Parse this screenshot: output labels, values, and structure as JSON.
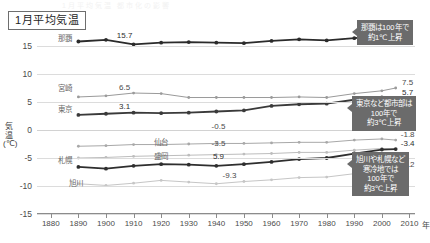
{
  "title": "1月平均気温",
  "top_crop_text": "1月平均気温 都市化の影響",
  "chart_data": {
    "type": "line",
    "title": "1月平均気温",
    "xlabel": "年",
    "ylabel": "気温(℃)",
    "ylim": [
      -15,
      17.5
    ],
    "xlim": [
      1875,
      2012
    ],
    "grid": true,
    "legend": "inline-labels",
    "yticks": [
      15,
      10,
      5,
      0,
      -5,
      -10,
      -15
    ],
    "ytick_labels": [
      "15",
      "10",
      "5",
      "0",
      "-5",
      "-10",
      "-15"
    ],
    "xticks": [
      1880,
      1890,
      1900,
      1910,
      1920,
      1930,
      1940,
      1950,
      1960,
      1970,
      1980,
      1990,
      2000,
      2010
    ],
    "xtick_labels": [
      "1880",
      "1890",
      "1900",
      "1910",
      "1920",
      "1930",
      "1940",
      "1950",
      "1960",
      "1970",
      "1980",
      "1990",
      "2000",
      "2010"
    ],
    "x_unit": "年",
    "x": [
      1890,
      1900,
      1910,
      1920,
      1930,
      1940,
      1950,
      1960,
      1970,
      1980,
      1990,
      2000,
      2005
    ],
    "series": [
      {
        "name": "那覇",
        "color": "#2b2b2b",
        "weight": "bold",
        "label_x": 1893,
        "label_value": 15.7,
        "label_text": "15.7",
        "end_label": "17",
        "values": [
          15.8,
          16.1,
          15.3,
          15.6,
          15.7,
          15.6,
          15.5,
          15.9,
          16.2,
          16.0,
          16.4,
          16.8,
          17.0
        ]
      },
      {
        "name": "宮崎",
        "color": "#9a9a9a",
        "weight": "normal",
        "label_x": 1893,
        "label_value": 6.5,
        "label_text": "6.5",
        "end_label": "7.5",
        "values": [
          5.9,
          6.1,
          6.6,
          6.5,
          5.8,
          5.8,
          5.8,
          5.8,
          5.9,
          5.8,
          6.5,
          7.0,
          7.5
        ]
      },
      {
        "name": "東京",
        "color": "#3a3a3a",
        "weight": "bold",
        "label_x": 1893,
        "label_value": 3.1,
        "label_text": "3.1",
        "end_label": "5.7",
        "values": [
          2.7,
          2.9,
          3.1,
          3.0,
          3.1,
          3.3,
          3.5,
          4.3,
          4.6,
          4.7,
          5.4,
          5.8,
          5.7
        ]
      },
      {
        "name": "仙台",
        "color": "#a8a8a8",
        "weight": "normal",
        "label_x": 1927,
        "label_value": -0.5,
        "label_text": "-0.5",
        "end_label": "-1.8",
        "values": [
          -2.9,
          -2.8,
          -2.6,
          -2.6,
          -2.5,
          -2.4,
          -2.4,
          -2.3,
          -2.2,
          -2.2,
          -1.8,
          -1.6,
          -1.8
        ]
      },
      {
        "name": "盛岡",
        "color": "#bdbdbd",
        "weight": "normal",
        "label_x": 1927,
        "label_value": -3.5,
        "label_text": "-3.5",
        "end_label": "",
        "values": [
          -5.0,
          -4.9,
          -4.7,
          -4.6,
          -4.5,
          -4.4,
          -4.3,
          -4.2,
          -4.0,
          -4.0,
          -3.6,
          -3.3,
          -3.5
        ]
      },
      {
        "name": "札幌",
        "color": "#2e2e2e",
        "weight": "bold",
        "label_x": 1927,
        "label_value": -5.9,
        "label_text": "5.9",
        "end_label": "-3.4",
        "values": [
          -6.6,
          -6.9,
          -6.4,
          -6.1,
          -6.2,
          -6.4,
          -6.1,
          -5.7,
          -5.2,
          -5.0,
          -4.2,
          -3.5,
          -3.4
        ]
      },
      {
        "name": "旭川",
        "color": "#c6c6c6",
        "weight": "normal",
        "label_x": 1931,
        "label_value": -9.3,
        "label_text": "-9.3",
        "end_label": "-7.2",
        "values": [
          -9.6,
          -9.9,
          -9.5,
          -9.0,
          -9.3,
          -9.6,
          -9.2,
          -8.9,
          -8.5,
          -8.4,
          -7.8,
          -7.2,
          -7.2
        ]
      }
    ],
    "series_name_labels": [
      {
        "name": "那覇",
        "text": "那覇",
        "x": 1885,
        "y": 16.6
      },
      {
        "name": "宮崎",
        "text": "宮崎",
        "x": 1885,
        "y": 7.6
      },
      {
        "name": "東京",
        "text": "東京",
        "x": 1885,
        "y": 4.0
      },
      {
        "name": "仙台",
        "text": "仙台",
        "x": 1920,
        "y": -1.9
      },
      {
        "name": "盛岡",
        "text": "盛岡",
        "x": 1920,
        "y": -4.4
      },
      {
        "name": "札幌",
        "text": "札幌",
        "x": 1885,
        "y": -5.2
      },
      {
        "name": "旭川",
        "text": "旭川",
        "x": 1889,
        "y": -9.2
      }
    ],
    "annotations": [
      {
        "id": "naha-callout",
        "lines": [
          "那覇は100年で",
          "約1℃上昇"
        ],
        "target_series": "那覇"
      },
      {
        "id": "urban-callout",
        "lines": [
          "東京など都市部は",
          "100年で",
          "約3℃上昇"
        ],
        "target_series": "東京"
      },
      {
        "id": "cold-region-callout",
        "lines": [
          "旭川や札幌など",
          "寒冷地では",
          "100年で",
          "約3℃上昇"
        ],
        "target_series": "札幌"
      }
    ]
  }
}
